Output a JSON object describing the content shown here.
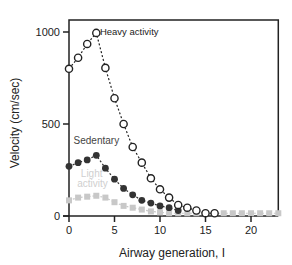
{
  "chart_data": {
    "type": "line",
    "title": "",
    "xlabel": "Airway generation, I",
    "ylabel": "Velocity (cm/sec)",
    "xlim": [
      0,
      23
    ],
    "ylim": [
      0,
      1050
    ],
    "xticks": [
      0,
      5,
      10,
      15,
      20
    ],
    "yticks": [
      0,
      500,
      1000
    ],
    "grid": false,
    "legend_position": "inline labels",
    "series": [
      {
        "name": "Heavy activity",
        "marker": "open-circle",
        "color": "#222222",
        "x": [
          0,
          1,
          2,
          3,
          4,
          5,
          6,
          7,
          8,
          9,
          10,
          11,
          12,
          13,
          14,
          15,
          16
        ],
        "values": [
          800,
          860,
          935,
          995,
          805,
          640,
          500,
          375,
          290,
          205,
          145,
          100,
          60,
          45,
          30,
          15,
          15
        ]
      },
      {
        "name": "Sedentary",
        "marker": "filled-circle",
        "color": "#333333",
        "x": [
          0,
          1,
          2,
          3,
          4,
          5,
          6,
          7,
          8,
          9,
          10,
          11,
          12
        ],
        "values": [
          270,
          290,
          305,
          330,
          260,
          200,
          150,
          115,
          85,
          70,
          55,
          45,
          30
        ]
      },
      {
        "name": "Light activity",
        "marker": "filled-square",
        "color": "#c8c8c8",
        "x": [
          0,
          1,
          2,
          3,
          4,
          5,
          6,
          7,
          8,
          9,
          10,
          11,
          12,
          13,
          14,
          15,
          16,
          17,
          18,
          19,
          20,
          21,
          22,
          23
        ],
        "values": [
          85,
          100,
          105,
          110,
          100,
          75,
          55,
          45,
          35,
          25,
          20,
          15,
          15,
          15,
          15,
          15,
          15,
          15,
          15,
          15,
          15,
          15,
          15,
          15
        ]
      }
    ],
    "annotations": [
      {
        "text": "Heavy activity",
        "x": 3.4,
        "y": 1000
      },
      {
        "text": "Sedentary",
        "x": 0.5,
        "y": 410
      },
      {
        "text": "Light",
        "x": 1.3,
        "y": 230
      },
      {
        "text": "activity",
        "x": 0.9,
        "y": 175
      }
    ]
  }
}
